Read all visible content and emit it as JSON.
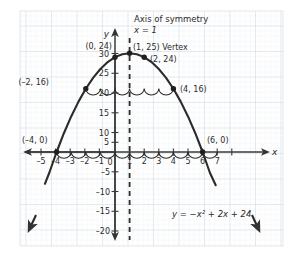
{
  "chart_data": {
    "type": "line",
    "title": "",
    "equation": "y = −x² + 2x + 24",
    "function": "y = -x^2 + 2x + 24",
    "xlabel": "x",
    "ylabel": "y",
    "xlim": [
      -5.6,
      7.6
    ],
    "ylim": [
      -23,
      32
    ],
    "grid": true,
    "grid_style": "graph-paper",
    "legend": "none",
    "x": [
      -4.8,
      -4.5,
      -4,
      -3.5,
      -3,
      -2.5,
      -2,
      -1.5,
      -1,
      -0.5,
      0,
      0.5,
      1,
      1.5,
      2,
      2.5,
      3,
      3.5,
      4,
      4.5,
      5,
      5.5,
      6,
      6.5,
      6.9
    ],
    "values": [
      -8.04,
      -5.25,
      0,
      4.75,
      9,
      12.75,
      16,
      18.75,
      21,
      22.75,
      24,
      24.75,
      25,
      24.75,
      24,
      22.75,
      21,
      18.75,
      16,
      12.75,
      9,
      4.75,
      0,
      -5.25,
      -8.41
    ],
    "xticks": [
      -5,
      -4,
      -3,
      -2,
      -1,
      0,
      1,
      2,
      3,
      4,
      5,
      6,
      7
    ],
    "xticklabels": [
      "–5",
      "–4",
      "–3",
      "–2",
      "–1",
      "0",
      "1",
      "2",
      "3",
      "4",
      "5",
      "6",
      "7"
    ],
    "yticks": [
      30,
      25,
      20,
      15,
      10,
      5,
      -5,
      -10,
      -15,
      -20
    ],
    "yticklabels": [
      "30",
      "25",
      "20",
      "15",
      "10",
      "5",
      "–5",
      "–10",
      "–15",
      "–20"
    ],
    "origin_label": "0",
    "axis_of_symmetry": {
      "label": "Axis of symmetry",
      "equation": "x = 1",
      "x": 1,
      "style": "dashed"
    },
    "points": [
      {
        "name": "left-root",
        "label": "(–4, 0)",
        "x": -4,
        "y": 0,
        "marker": true
      },
      {
        "name": "left-16",
        "label": "(–2, 16)",
        "x": -2,
        "y": 16,
        "marker": true
      },
      {
        "name": "y-intercept",
        "label": "(0, 24)",
        "x": 0,
        "y": 24,
        "marker": true
      },
      {
        "name": "vertex",
        "label": "(1, 25) Vertex",
        "x": 1,
        "y": 25,
        "marker": true
      },
      {
        "name": "right-24",
        "label": "(2, 24)",
        "x": 2,
        "y": 24,
        "marker": true
      },
      {
        "name": "right-16",
        "label": "(4, 16)",
        "x": 4,
        "y": 16,
        "marker": true
      },
      {
        "name": "right-root",
        "label": "(6, 0)",
        "x": 6,
        "y": 0,
        "marker": true
      }
    ],
    "symmetry_arcs": {
      "y_level_16": {
        "from": -2,
        "to": 4,
        "count": 6
      },
      "y_level_0": {
        "from": -4,
        "to": 6,
        "count": 10
      }
    },
    "annotations": [
      {
        "name": "axis-of-symmetry-title",
        "text": "Axis of symmetry"
      },
      {
        "name": "axis-of-symmetry-equation",
        "text": "x = 1"
      },
      {
        "name": "equation-annotation",
        "text": "y = −x² + 2x + 24"
      }
    ],
    "colors": {
      "curve": "#2b2b2b",
      "axis": "#3a3a3a",
      "grid_minor": "#e3e9ee",
      "grid_major": "#cfd8e0",
      "text": "#2b2b2b",
      "paper": "#ffffff"
    }
  },
  "labels": {
    "axis_x": "x",
    "axis_y": "y",
    "origin": "0",
    "axis_symmetry_title": "Axis of symmetry",
    "axis_symmetry_eq": "x = 1",
    "equation": "y = −x² + 2x + 24",
    "pt_left_root": "(–4, 0)",
    "pt_left_16": "(–2, 16)",
    "pt_y_intercept": "(0, 24)",
    "pt_vertex": "(1, 25) Vertex",
    "pt_right_24": "(2, 24)",
    "pt_right_16": "(4, 16)",
    "pt_right_root": "(6, 0)",
    "xt_m5": "–5",
    "xt_m4": "–4",
    "xt_m3": "–3",
    "xt_m2": "–2",
    "xt_m1": "–1",
    "xt_1": "1",
    "xt_2": "2",
    "xt_3": "3",
    "xt_4": "4",
    "xt_5": "5",
    "xt_6": "6",
    "xt_7": "7",
    "yt_30": "30",
    "yt_25": "25",
    "yt_20": "20",
    "yt_15": "15",
    "yt_10": "10",
    "yt_5": "5",
    "yt_m5": "–5",
    "yt_m10": "–10",
    "yt_m15": "–15",
    "yt_m20": "–20"
  }
}
